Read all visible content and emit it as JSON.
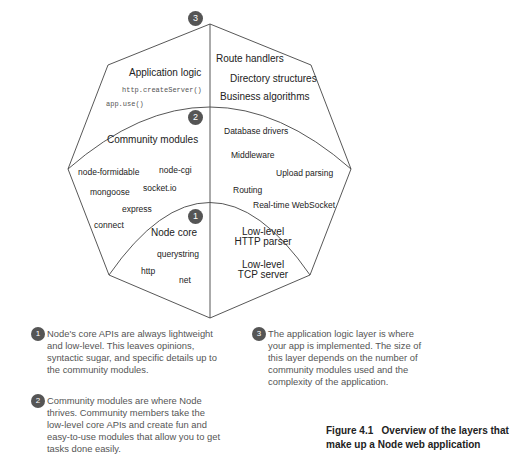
{
  "layers": {
    "application": {
      "badge": "3",
      "title": "Application logic",
      "code_items": [
        "http.createServer()",
        "app.use()"
      ],
      "right_items": [
        "Route handlers",
        "Directory structures",
        "Business algorithms"
      ]
    },
    "community": {
      "badge": "2",
      "title": "Community modules",
      "left_items": [
        "node-formidable",
        "node-cgi",
        "mongoose",
        "socket.io",
        "express",
        "connect"
      ],
      "right_items": [
        "Database drivers",
        "Middleware",
        "Upload parsing",
        "Routing",
        "Real-time WebSocket"
      ]
    },
    "core": {
      "badge": "1",
      "title": "Node core",
      "left_items": [
        "querystring",
        "http",
        "net"
      ],
      "right_items": [
        {
          "line1": "Low-level",
          "line2": "HTTP parser"
        },
        {
          "line1": "Low-level",
          "line2": "TCP server"
        }
      ]
    }
  },
  "notes": [
    {
      "badge": "1",
      "text": "Node's core APIs are always lightweight and low-level. This leaves opinions, syntactic sugar, and specific details up to the community modules."
    },
    {
      "badge": "2",
      "text": "Community modules are where Node thrives. Community members take the low-level core APIs and create fun and easy-to-use modules that allow you to get tasks done easily."
    },
    {
      "badge": "3",
      "text": "The application logic layer is where your app is implemented. The size of this layer depends on the number of community modules used and the complexity of the application."
    }
  ],
  "caption": {
    "line1": "Figure 4.1   Overview of the layers that",
    "line2": "make up a Node web application"
  },
  "colors": {
    "line": "#444444",
    "badge": "#555555",
    "text": "#222222",
    "note_text": "#555555"
  }
}
